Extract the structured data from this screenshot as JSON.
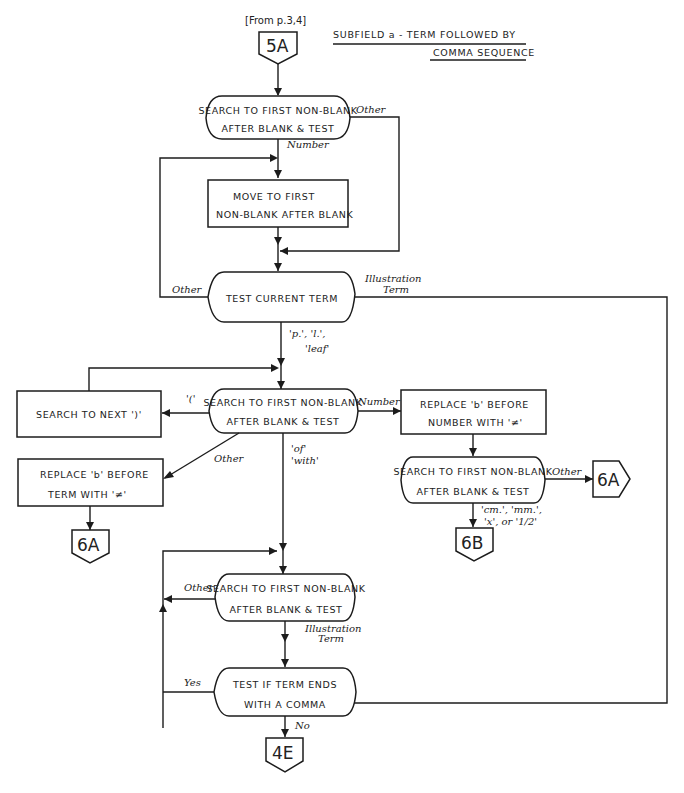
{
  "title": {
    "line1": "SUBFIELD a - TERM FOLLOWED BY",
    "line2": "COMMA SEQUENCE"
  },
  "entry": {
    "from_note": "[From p.3,4]",
    "connector": "5A"
  },
  "nodes": {
    "search1": {
      "line1": "SEARCH TO FIRST NON-BLANK",
      "line2": "AFTER BLANK & TEST"
    },
    "move1": {
      "line1": "MOVE TO FIRST",
      "line2": "NON-BLANK AFTER BLANK"
    },
    "test_term": {
      "line1": "TEST CURRENT TERM"
    },
    "search2": {
      "line1": "SEARCH TO FIRST NON-BLANK",
      "line2": "AFTER BLANK & TEST"
    },
    "search_paren": {
      "line1": "SEARCH TO NEXT ')'"
    },
    "replace_term": {
      "line1": "REPLACE 'b' BEFORE",
      "line2": "TERM WITH '≠'"
    },
    "replace_number": {
      "line1": "REPLACE 'b' BEFORE",
      "line2": "NUMBER WITH '≠'"
    },
    "search3": {
      "line1": "SEARCH TO FIRST NON-BLANK",
      "line2": "AFTER BLANK & TEST"
    },
    "search4": {
      "line1": "SEARCH TO FIRST NON-BLANK",
      "line2": "AFTER BLANK & TEST"
    },
    "test_comma": {
      "line1": "TEST IF TERM ENDS",
      "line2": "WITH A COMMA"
    }
  },
  "connectors": {
    "to_6a_left": "6A",
    "to_6a_right": "6A",
    "to_6b": "6B",
    "to_4e": "4E"
  },
  "edge_labels": {
    "search1_other": "Other",
    "search1_number": "Number",
    "test_other": "Other",
    "test_illus_1": "Illustration",
    "test_illus_2": "Term",
    "test_pl_1": "'p.', 'l.',",
    "test_pl_2": "'leaf'",
    "search2_paren": "'('",
    "search2_number": "Number",
    "search2_other": "Other",
    "search2_of": "'of'",
    "search2_with": "'with'",
    "search3_other": "Other",
    "search3_units_1": "'cm.', 'mm.',",
    "search3_units_2": "'x', or '1/2'",
    "search4_other": "Other",
    "search4_illus_1": "Illustration",
    "search4_illus_2": "Term",
    "comma_yes": "Yes",
    "comma_no": "No"
  },
  "colors": {
    "ink": "#1c1c1c",
    "paper": "#ffffff"
  }
}
